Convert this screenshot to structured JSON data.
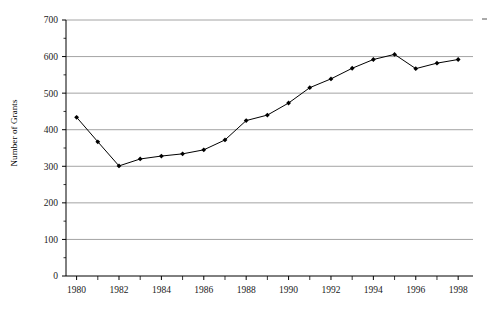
{
  "chart_data": {
    "type": "line",
    "title": "",
    "xlabel": "",
    "ylabel": "Number of Grants",
    "x": [
      1980,
      1981,
      1982,
      1983,
      1984,
      1985,
      1986,
      1987,
      1988,
      1989,
      1990,
      1991,
      1992,
      1993,
      1994,
      1995,
      1996,
      1997,
      1998
    ],
    "values": [
      434,
      367,
      301,
      320,
      328,
      334,
      345,
      372,
      425,
      440,
      473,
      515,
      539,
      568,
      592,
      606,
      567,
      582,
      592
    ],
    "series": [
      {
        "name": "Number of Grants",
        "values": [
          434,
          367,
          301,
          320,
          328,
          334,
          345,
          372,
          425,
          440,
          473,
          515,
          539,
          568,
          592,
          606,
          567,
          582,
          592
        ]
      }
    ],
    "ylim": [
      0,
      700
    ],
    "xlim": [
      1979.5,
      1998.7
    ],
    "y_ticks": [
      0,
      100,
      200,
      300,
      400,
      500,
      600,
      700
    ],
    "y_tick_labels": [
      "0",
      "100",
      "200",
      "300",
      "400",
      "500",
      "600",
      "700"
    ],
    "y_minor_ticks": [
      50,
      150,
      250,
      350,
      450,
      550,
      650
    ],
    "x_ticks": [
      1980,
      1982,
      1984,
      1986,
      1988,
      1990,
      1992,
      1994,
      1996,
      1998
    ],
    "x_tick_labels": [
      "1980",
      "1982",
      "1984",
      "1986",
      "1988",
      "1990",
      "1992",
      "1994",
      "1996",
      "1998"
    ],
    "x_minor_ticks": [
      1981,
      1983,
      1985,
      1987,
      1989,
      1991,
      1993,
      1995,
      1997
    ],
    "grid": "horizontal",
    "legend": "none",
    "marker": "filled-diamond",
    "line_color": "#000000",
    "grid_color": "#9a9a9a",
    "axis_color": "#000000",
    "background": "#ffffff"
  },
  "axis": {
    "y_title": "Number of Grants"
  }
}
